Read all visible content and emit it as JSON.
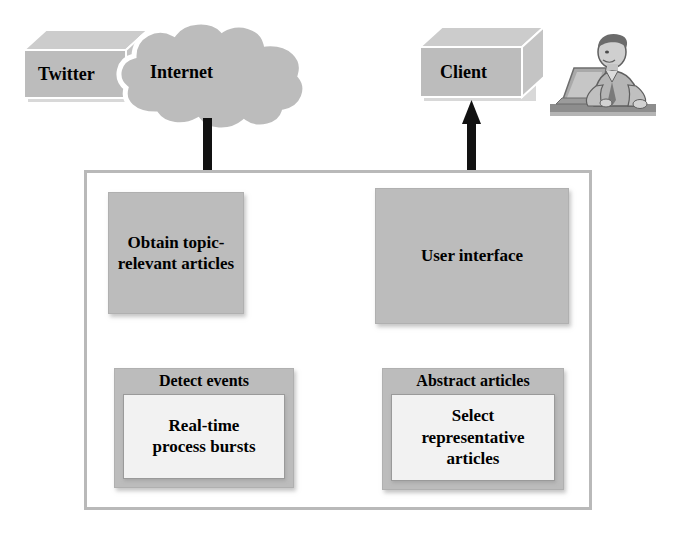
{
  "diagram": {
    "type": "flowchart",
    "colors": {
      "gray_fill": "#bcbcbc",
      "nested_fill": "#f2f2f2",
      "container_border": "#b9b9b9",
      "arrow": "#111111",
      "text": "#000000"
    },
    "external_nodes": [
      {
        "id": "twitter",
        "label": "Twitter",
        "shape": "3d-box"
      },
      {
        "id": "internet",
        "label": "Internet",
        "shape": "cloud"
      },
      {
        "id": "client",
        "label": "Client",
        "shape": "3d-box"
      },
      {
        "id": "person",
        "label": "person-at-laptop",
        "shape": "clipart"
      }
    ],
    "process_boxes": [
      {
        "id": "obtain",
        "label": "Obtain topic-relevant articles",
        "line1": "Obtain topic-",
        "line2": "relevant articles",
        "shape": "rect"
      },
      {
        "id": "user_interface",
        "label": "User interface",
        "shape": "rect"
      }
    ],
    "group_boxes": [
      {
        "id": "detect",
        "header": "Detect events",
        "nested_label": "Real-time process bursts",
        "nested_line1": "Real-time",
        "nested_line2": "process bursts"
      },
      {
        "id": "abstract",
        "header": "Abstract articles",
        "nested_label": "Select representative articles",
        "nested_line1": "Select",
        "nested_line2": "representative",
        "nested_line3": "articles"
      }
    ],
    "edges": [
      {
        "id": "internet-to-obtain",
        "from": "internet",
        "to": "obtain",
        "direction": "down"
      },
      {
        "id": "obtain-to-detect",
        "from": "obtain",
        "to": "detect",
        "direction": "down"
      },
      {
        "id": "detect-to-abstract",
        "from": "detect",
        "to": "abstract",
        "direction": "right"
      },
      {
        "id": "abstract-to-user-interface",
        "from": "abstract",
        "to": "user_interface",
        "direction": "up"
      },
      {
        "id": "user-interface-to-client",
        "from": "user_interface",
        "to": "client",
        "direction": "up"
      }
    ]
  }
}
